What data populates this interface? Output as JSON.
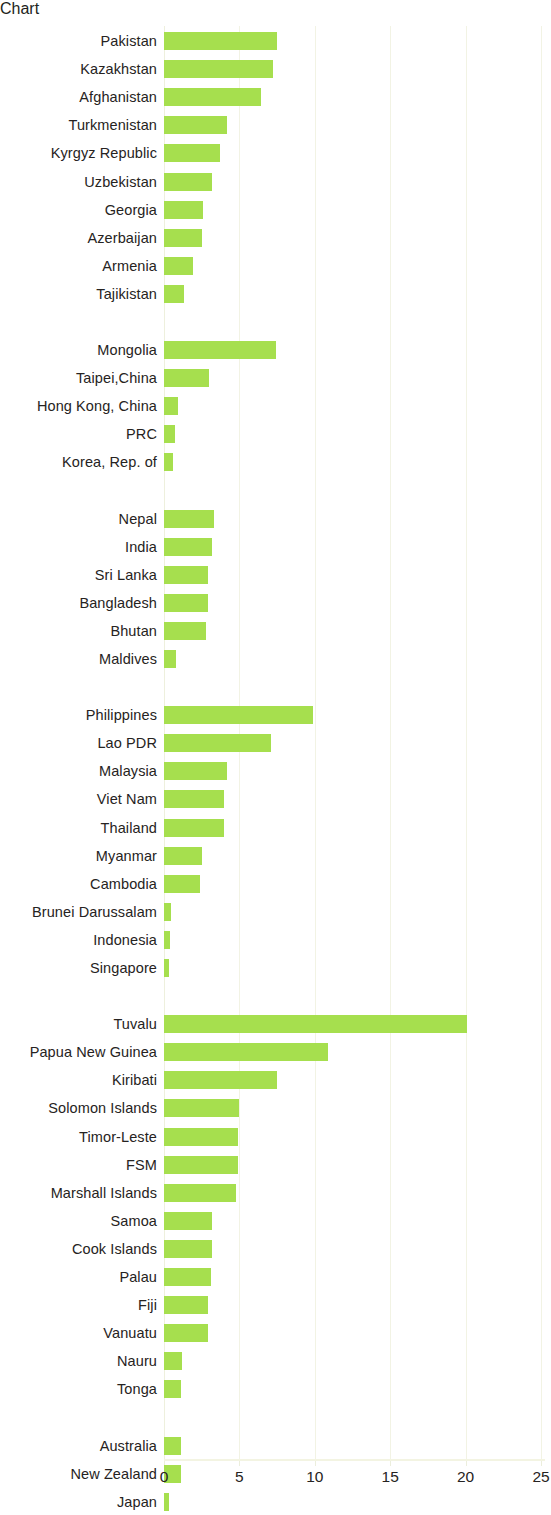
{
  "chart_data": {
    "type": "bar",
    "orientation": "horizontal",
    "title": "",
    "subtitle": "",
    "xlabel": "",
    "ylabel": "",
    "xlim": [
      0,
      25
    ],
    "xticks": [
      0,
      5,
      10,
      15,
      20,
      25
    ],
    "xtick_labels": [
      "0",
      "5",
      "10",
      "15",
      "20",
      "25"
    ],
    "grid": true,
    "legend": null,
    "bar_color": "#a6df4e",
    "axis_color": "#f2f3e4",
    "text_color": "#262322",
    "groups": [
      {
        "name": "Central and West Asia",
        "categories": [
          "Pakistan",
          "Kazakhstan",
          "Afghanistan",
          "Turkmenistan",
          "Kyrgyz Republic",
          "Uzbekistan",
          "Georgia",
          "Azerbaijan",
          "Armenia",
          "Tajikistan"
        ],
        "values": [
          7.5,
          7.2,
          6.4,
          4.2,
          3.7,
          3.2,
          2.6,
          2.5,
          1.9,
          1.3
        ]
      },
      {
        "name": "East Asia",
        "categories": [
          "Mongolia",
          "Taipei,China",
          "Hong Kong, China",
          "PRC",
          "Korea, Rep. of"
        ],
        "values": [
          7.4,
          3.0,
          0.9,
          0.75,
          0.6
        ]
      },
      {
        "name": "South Asia",
        "categories": [
          "Nepal",
          "India",
          "Sri Lanka",
          "Bangladesh",
          "Bhutan",
          "Maldives"
        ],
        "values": [
          3.3,
          3.2,
          2.9,
          2.9,
          2.8,
          0.8
        ]
      },
      {
        "name": "Southeast Asia",
        "categories": [
          "Philippines",
          "Lao PDR",
          "Malaysia",
          "Viet Nam",
          "Thailand",
          "Myanmar",
          "Cambodia",
          "Brunei Darussalam",
          "Indonesia",
          "Singapore"
        ],
        "values": [
          9.9,
          7.1,
          4.2,
          4.0,
          4.0,
          2.5,
          2.4,
          0.45,
          0.4,
          0.3
        ]
      },
      {
        "name": "The Pacific",
        "categories": [
          "Tuvalu",
          "Papua New Guinea",
          "Kiribati",
          "Solomon Islands",
          "Timor-Leste",
          "FSM",
          "Marshall Islands",
          "Samoa",
          "Cook Islands",
          "Palau",
          "Fiji",
          "Vanuatu",
          "Nauru",
          "Tonga"
        ],
        "values": [
          20.1,
          10.9,
          7.5,
          5.0,
          4.9,
          4.9,
          4.8,
          3.2,
          3.2,
          3.1,
          2.9,
          2.9,
          1.2,
          1.1
        ]
      },
      {
        "name": "Developed Member Countries",
        "categories": [
          "Australia",
          "New Zealand",
          "Japan"
        ],
        "values": [
          1.1,
          1.1,
          0.35
        ]
      }
    ]
  }
}
